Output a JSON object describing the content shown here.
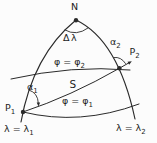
{
  "figure": {
    "background": "#fcfcfc",
    "line_color": "#2a2a2a",
    "text_color": "#1e1e1e",
    "labels": {
      "north_pole": "N",
      "delta_lambda": "Δλ",
      "alpha_1": {
        "base": "α",
        "sub": "1"
      },
      "alpha_2": {
        "base": "α",
        "sub": "2"
      },
      "point_1": {
        "base": "P",
        "sub": "1"
      },
      "point_2": {
        "base": "P",
        "sub": "2"
      },
      "parallel_1": {
        "base": "φ = φ",
        "sub": "1"
      },
      "parallel_2": {
        "base": "φ = φ",
        "sub": "2"
      },
      "meridian_1": {
        "base": "λ = λ",
        "sub": "1"
      },
      "meridian_2": {
        "base": "λ = λ",
        "sub": "2"
      },
      "distance": "S"
    }
  }
}
